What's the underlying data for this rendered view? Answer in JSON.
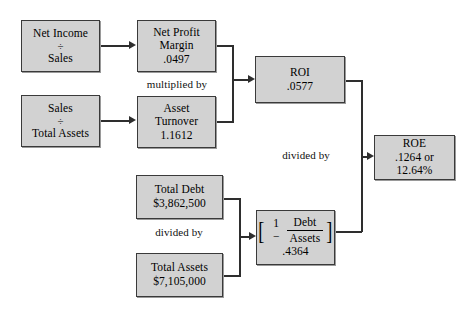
{
  "diagram": {
    "box_fill_color": "#d2d2d2",
    "box_border_color": "#3a3a3a",
    "connector_color": "#2e2e2e",
    "background_color": "#ffffff"
  },
  "boxes": {
    "net_income_sales": {
      "line1": "Net Income",
      "operator": "÷",
      "line2": "Sales"
    },
    "sales_total_assets": {
      "line1": "Sales",
      "operator": "÷",
      "line2": "Total Assets"
    },
    "net_profit_margin": {
      "line1": "Net Profit",
      "line2": "Margin",
      "value": ".0497"
    },
    "asset_turnover": {
      "line1": "Asset",
      "line2": "Turnover",
      "value": "1.1612"
    },
    "roi": {
      "line1": "ROI",
      "value": ".0577"
    },
    "total_debt": {
      "line1": "Total Debt",
      "value": "$3,862,500"
    },
    "total_assets": {
      "line1": "Total Assets",
      "value": "$7,105,000"
    },
    "equity_multiplier": {
      "bracket_open": "[",
      "bracket_close": "]",
      "one_minus": "1 −",
      "numerator": "Debt",
      "denominator": "Assets",
      "value": ".4364"
    },
    "roe": {
      "line1": "ROE",
      "line2": ".1264 or",
      "line3": "12.64%"
    }
  },
  "labels": {
    "multiplied_by": "multiplied by",
    "divided_by_lower_left": "divided by",
    "divided_by_right": "divided by"
  }
}
